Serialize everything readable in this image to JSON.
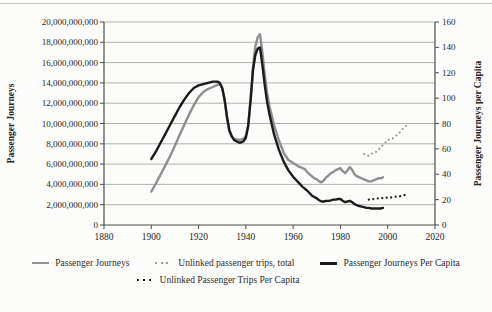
{
  "chart_data": {
    "type": "line",
    "title": "",
    "xlabel": "",
    "xlim": [
      1880,
      2020
    ],
    "x_ticks": [
      1880,
      1900,
      1920,
      1940,
      1960,
      1980,
      2000,
      2020
    ],
    "grid": "horizontal",
    "legend_position": "bottom",
    "left_axis": {
      "label": "Passenger Journeys",
      "max_billions": 20,
      "tick_step_billions": 2,
      "tick_labels": [
        "0",
        "2,000,000,000",
        "4,000,000,000",
        "6,000,000,000",
        "8,000,000,000",
        "10,000,000,000",
        "12,000,000,000",
        "14,000,000,000",
        "16,000,000,000",
        "18,000,000,000",
        "20,000,000,000"
      ]
    },
    "right_axis": {
      "label": "Passenger Journeys per Capita",
      "max": 160,
      "ticks": [
        0,
        20,
        40,
        60,
        80,
        100,
        120,
        140,
        160
      ]
    },
    "series": [
      {
        "name": "Passenger Journeys",
        "axis": "left",
        "units": "billions",
        "style": "solid",
        "color": "#8f8f8f",
        "width": 2.4,
        "points": [
          [
            1900,
            3.3
          ],
          [
            1902,
            4.1
          ],
          [
            1904,
            5.0
          ],
          [
            1906,
            5.9
          ],
          [
            1908,
            6.8
          ],
          [
            1910,
            7.8
          ],
          [
            1912,
            8.9
          ],
          [
            1914,
            9.9
          ],
          [
            1916,
            10.9
          ],
          [
            1918,
            11.8
          ],
          [
            1920,
            12.6
          ],
          [
            1922,
            13.1
          ],
          [
            1924,
            13.4
          ],
          [
            1926,
            13.6
          ],
          [
            1928,
            13.8
          ],
          [
            1929,
            13.9
          ],
          [
            1930,
            13.5
          ],
          [
            1931,
            12.3
          ],
          [
            1932,
            10.5
          ],
          [
            1933,
            9.2
          ],
          [
            1934,
            8.7
          ],
          [
            1935,
            8.5
          ],
          [
            1936,
            8.4
          ],
          [
            1937,
            8.4
          ],
          [
            1938,
            8.4
          ],
          [
            1939,
            8.5
          ],
          [
            1940,
            8.8
          ],
          [
            1941,
            9.8
          ],
          [
            1942,
            12.5
          ],
          [
            1943,
            15.5
          ],
          [
            1944,
            17.6
          ],
          [
            1945,
            18.5
          ],
          [
            1946,
            18.8
          ],
          [
            1947,
            17.0
          ],
          [
            1948,
            14.8
          ],
          [
            1949,
            13.0
          ],
          [
            1950,
            11.7
          ],
          [
            1952,
            9.8
          ],
          [
            1954,
            8.3
          ],
          [
            1956,
            7.1
          ],
          [
            1958,
            6.4
          ],
          [
            1960,
            6.1
          ],
          [
            1962,
            5.8
          ],
          [
            1964,
            5.6
          ],
          [
            1965,
            5.5
          ],
          [
            1966,
            5.2
          ],
          [
            1967,
            5.0
          ],
          [
            1968,
            4.8
          ],
          [
            1969,
            4.6
          ],
          [
            1970,
            4.5
          ],
          [
            1971,
            4.3
          ],
          [
            1972,
            4.2
          ],
          [
            1973,
            4.4
          ],
          [
            1974,
            4.7
          ],
          [
            1975,
            4.9
          ],
          [
            1976,
            5.1
          ],
          [
            1977,
            5.2
          ],
          [
            1978,
            5.4
          ],
          [
            1979,
            5.5
          ],
          [
            1980,
            5.6
          ],
          [
            1981,
            5.3
          ],
          [
            1982,
            5.1
          ],
          [
            1983,
            5.4
          ],
          [
            1984,
            5.7
          ],
          [
            1985,
            5.4
          ],
          [
            1986,
            5.0
          ],
          [
            1987,
            4.8
          ],
          [
            1988,
            4.7
          ],
          [
            1989,
            4.6
          ],
          [
            1990,
            4.5
          ],
          [
            1991,
            4.4
          ],
          [
            1992,
            4.3
          ],
          [
            1993,
            4.3
          ],
          [
            1994,
            4.4
          ],
          [
            1995,
            4.5
          ],
          [
            1996,
            4.6
          ],
          [
            1997,
            4.6
          ],
          [
            1998,
            4.7
          ]
        ]
      },
      {
        "name": "Unlinked passenger trips, total",
        "axis": "left",
        "units": "billions",
        "style": "dotted",
        "color": "#9a9a9a",
        "width": 2.1,
        "points": [
          [
            1990,
            7.0
          ],
          [
            1991,
            6.9
          ],
          [
            1992,
            6.8
          ],
          [
            1993,
            7.0
          ],
          [
            1994,
            7.1
          ],
          [
            1995,
            7.2
          ],
          [
            1996,
            7.4
          ],
          [
            1997,
            7.6
          ],
          [
            1998,
            7.9
          ],
          [
            1999,
            8.1
          ],
          [
            2000,
            8.4
          ],
          [
            2001,
            8.4
          ],
          [
            2002,
            8.5
          ],
          [
            2003,
            8.7
          ],
          [
            2004,
            8.9
          ],
          [
            2005,
            9.1
          ],
          [
            2006,
            9.4
          ],
          [
            2007,
            9.6
          ],
          [
            2008,
            9.8
          ]
        ]
      },
      {
        "name": "Passenger Journeys Per Capita",
        "axis": "right",
        "units": "journeys per capita",
        "style": "solid",
        "color": "#1b1b1b",
        "width": 2.4,
        "points": [
          [
            1900,
            52
          ],
          [
            1902,
            58
          ],
          [
            1904,
            65
          ],
          [
            1906,
            72
          ],
          [
            1908,
            79
          ],
          [
            1910,
            86
          ],
          [
            1912,
            93
          ],
          [
            1914,
            99
          ],
          [
            1916,
            104
          ],
          [
            1918,
            108
          ],
          [
            1920,
            110
          ],
          [
            1922,
            111
          ],
          [
            1924,
            112
          ],
          [
            1926,
            113
          ],
          [
            1928,
            113
          ],
          [
            1929,
            112
          ],
          [
            1930,
            108
          ],
          [
            1931,
            99
          ],
          [
            1932,
            86
          ],
          [
            1933,
            75
          ],
          [
            1934,
            70
          ],
          [
            1935,
            67
          ],
          [
            1936,
            66
          ],
          [
            1937,
            65
          ],
          [
            1938,
            65
          ],
          [
            1939,
            66
          ],
          [
            1940,
            69
          ],
          [
            1941,
            78
          ],
          [
            1942,
            98
          ],
          [
            1943,
            122
          ],
          [
            1944,
            134
          ],
          [
            1945,
            139
          ],
          [
            1946,
            140
          ],
          [
            1947,
            126
          ],
          [
            1948,
            110
          ],
          [
            1949,
            97
          ],
          [
            1950,
            87
          ],
          [
            1952,
            71
          ],
          [
            1954,
            59
          ],
          [
            1956,
            50
          ],
          [
            1958,
            43
          ],
          [
            1960,
            38
          ],
          [
            1962,
            34
          ],
          [
            1964,
            30
          ],
          [
            1966,
            27
          ],
          [
            1968,
            23
          ],
          [
            1970,
            21
          ],
          [
            1971,
            19.5
          ],
          [
            1972,
            18.5
          ],
          [
            1973,
            18.5
          ],
          [
            1974,
            19
          ],
          [
            1975,
            19
          ],
          [
            1976,
            19.5
          ],
          [
            1977,
            20
          ],
          [
            1978,
            20
          ],
          [
            1979,
            20.5
          ],
          [
            1980,
            20.5
          ],
          [
            1981,
            19
          ],
          [
            1982,
            18
          ],
          [
            1983,
            18.5
          ],
          [
            1984,
            19
          ],
          [
            1985,
            18
          ],
          [
            1986,
            16.5
          ],
          [
            1987,
            15.5
          ],
          [
            1988,
            15
          ],
          [
            1989,
            14.5
          ],
          [
            1990,
            14
          ],
          [
            1991,
            13.5
          ],
          [
            1992,
            13.5
          ],
          [
            1993,
            13
          ],
          [
            1994,
            13
          ],
          [
            1995,
            13
          ],
          [
            1996,
            13
          ],
          [
            1997,
            13
          ],
          [
            1998,
            13.5
          ]
        ]
      },
      {
        "name": "Unlinked Passenger Trips Per Capita",
        "axis": "right",
        "units": "trips per capita",
        "style": "dotted",
        "color": "#1b1b1b",
        "width": 2.2,
        "points": [
          [
            1992,
            20
          ],
          [
            1993,
            20.2
          ],
          [
            1994,
            20.5
          ],
          [
            1995,
            20.7
          ],
          [
            1996,
            21
          ],
          [
            1997,
            21
          ],
          [
            1998,
            21.2
          ],
          [
            1999,
            21.5
          ],
          [
            2000,
            21.7
          ],
          [
            2001,
            21.7
          ],
          [
            2002,
            22
          ],
          [
            2003,
            22.2
          ],
          [
            2004,
            22.5
          ],
          [
            2005,
            22.7
          ],
          [
            2006,
            23
          ],
          [
            2007,
            23.5
          ],
          [
            2008,
            24
          ]
        ]
      }
    ]
  }
}
